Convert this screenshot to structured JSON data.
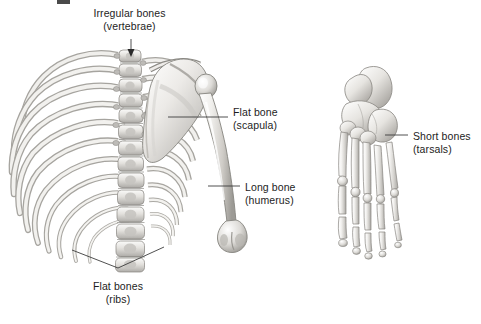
{
  "figure": {
    "background_color": "#ffffff",
    "ink_color": "#1d1d1d",
    "bone_light": "#f2f1ef",
    "bone_mid": "#cfcdc9",
    "bone_dark": "#8d8b87",
    "leader_color": "#3c3c3c"
  },
  "labels": {
    "vertebrae": {
      "line1": "Irregular bones",
      "line2": "(vertebrae)",
      "leader": "vertical-arrow-down"
    },
    "scapula": {
      "line1": "Flat bone",
      "line2": "(scapula)",
      "leader": "horizontal-left"
    },
    "humerus": {
      "line1": "Long bone",
      "line2": "(humerus)",
      "leader": "horizontal-left"
    },
    "tarsals": {
      "line1": "Short bones",
      "line2": "(tarsals)",
      "leader": "horizontal-left"
    },
    "ribs": {
      "line1": "Flat bones",
      "line2": "(ribs)",
      "leader": "v-bracket-up"
    }
  },
  "structures": {
    "thorax": "rib-cage-with-vertebral-column",
    "shoulder": "scapula-and-humerus",
    "foot": "foot-skeleton-tarsals-metatarsals-phalanges"
  }
}
